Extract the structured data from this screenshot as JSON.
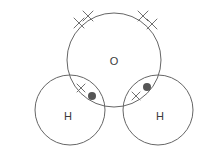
{
  "diagram": {
    "type": "dot-and-cross",
    "molecule": "H2O",
    "background_color": "#ffffff",
    "outline_color": "#666666",
    "outline_width": 1,
    "label_color": "#3a3a3a",
    "dot_color": "#555555",
    "cross_color": "#707070",
    "canvas": {
      "width": 207,
      "height": 167
    },
    "atoms": [
      {
        "id": "oxygen",
        "label": "O",
        "element": "O",
        "cx": 114,
        "cy": 60,
        "r": 47,
        "label_x": 114,
        "label_y": 62
      },
      {
        "id": "hydrogen-left",
        "label": "H",
        "element": "H",
        "cx": 70,
        "cy": 110,
        "r": 35,
        "label_x": 68,
        "label_y": 117
      },
      {
        "id": "hydrogen-right",
        "label": "H",
        "element": "H",
        "cx": 158,
        "cy": 110,
        "r": 35,
        "label_x": 160,
        "label_y": 117
      }
    ],
    "lone_pairs": [
      {
        "id": "lone-pair-top-left",
        "owner": "oxygen",
        "symbol": "cross",
        "electrons": [
          {
            "cx": 88,
            "cy": 16,
            "size": 5
          },
          {
            "cx": 79,
            "cy": 23,
            "size": 5
          }
        ]
      },
      {
        "id": "lone-pair-top-right",
        "owner": "oxygen",
        "symbol": "cross",
        "electrons": [
          {
            "cx": 143,
            "cy": 16,
            "size": 5
          },
          {
            "cx": 152,
            "cy": 24,
            "size": 5
          }
        ]
      }
    ],
    "bonding_pairs": [
      {
        "id": "bond-pair-left",
        "between": [
          "oxygen",
          "hydrogen-left"
        ],
        "cross": {
          "cx": 81,
          "cy": 88,
          "size": 4
        },
        "dot": {
          "cx": 92,
          "cy": 96,
          "r": 4
        }
      },
      {
        "id": "bond-pair-right",
        "between": [
          "oxygen",
          "hydrogen-right"
        ],
        "cross": {
          "cx": 136,
          "cy": 96,
          "size": 4
        },
        "dot": {
          "cx": 147,
          "cy": 87,
          "r": 4
        }
      }
    ]
  }
}
